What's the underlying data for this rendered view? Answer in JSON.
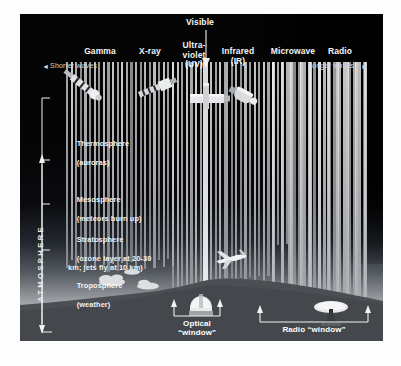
{
  "figure": {
    "title_visible": "Visible",
    "bands": [
      {
        "id": "gamma",
        "label": "Gamma",
        "sub": "",
        "x": 80,
        "y": 36
      },
      {
        "id": "xray",
        "label": "X-ray",
        "sub": "",
        "x": 130,
        "y": 36
      },
      {
        "id": "ultraviolet",
        "label": "Ultra-\nviolet\n(UV)",
        "sub": "",
        "x": 175,
        "y": 32
      },
      {
        "id": "infrared",
        "label": "Infrared\n(IR)",
        "sub": "",
        "x": 218,
        "y": 36
      },
      {
        "id": "microwave",
        "label": "Microwave",
        "sub": "",
        "x": 272,
        "y": 36
      },
      {
        "id": "radio",
        "label": "Radio",
        "sub": "",
        "x": 320,
        "y": 36
      }
    ],
    "edges": {
      "left_label": "Shorter waves",
      "left_arrow": "◄",
      "right_label": "Longer waves",
      "right_arrow": "►"
    },
    "atmosphere_axis_label": "ATMOSPHERE",
    "layers": [
      {
        "id": "thermosphere",
        "name": "Thermosphere",
        "detail": "(auroras)"
      },
      {
        "id": "mesosphere",
        "name": "Mesosphere",
        "detail": "(meteors burn up)"
      },
      {
        "id": "stratosphere",
        "name": "Stratosphere",
        "detail": "(ozone layer at 20-30\nkm; jets fly at 10 km)"
      },
      {
        "id": "troposphere",
        "name": "Troposphere",
        "detail": "(weather)"
      }
    ],
    "windows": [
      {
        "id": "optical",
        "label": "Optical\n“window”"
      },
      {
        "id": "radio",
        "label": "Radio “window”"
      }
    ],
    "colors": {
      "panel_background": "#050505",
      "bar_color": "#d9dadc",
      "text_color": "#f2f3f4",
      "ground_color": "#4b4f53",
      "page_background": "#fdfdfd"
    }
  },
  "chart_data": {
    "type": "bar",
    "xlabel": "Electromagnetic spectrum (shorter waves → longer waves)",
    "ylabel": "Altitude in atmosphere",
    "categories": [
      "Gamma",
      "X-ray",
      "Ultraviolet (UV)",
      "Visible",
      "Infrared (IR)",
      "Microwave",
      "Radio"
    ],
    "series": [
      {
        "name": "Atmospheric absorption (opacity %)",
        "values": [
          100,
          100,
          100,
          0,
          75,
          45,
          0
        ]
      }
    ],
    "annotations": [
      "Optical “window” at visible wavelengths reaches the ground",
      "Radio “window” at long wavelengths reaches the ground",
      "Gamma, X-ray and UV are absorbed high in the atmosphere"
    ],
    "grid": false,
    "legend": "none"
  }
}
